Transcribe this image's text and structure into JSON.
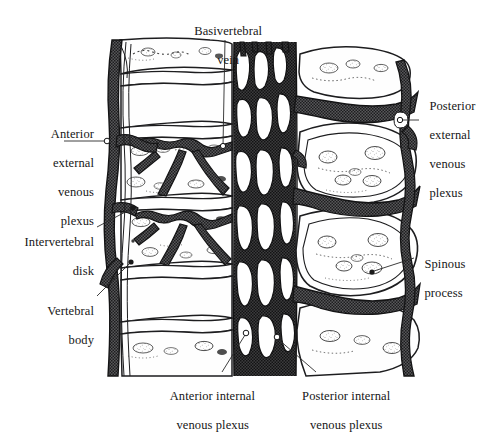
{
  "figure": {
    "kind": "anatomical-illustration",
    "background_color": "#ffffff",
    "ink_color": "#1a1a1a",
    "vein_fill_color": "#4a4a4a",
    "bone_fill_color": "#fdfdfd",
    "drawing_bounds": {
      "x": 100,
      "y": 38,
      "width": 322,
      "height": 340
    }
  },
  "labels": [
    {
      "id": "basivertebral-vein",
      "name": "basivertebral-vein",
      "lines": [
        "Basivertebral",
        "vein"
      ],
      "align": "center",
      "x": 164,
      "y": 10,
      "width": 122,
      "leader": {
        "from": [
          225,
          40
        ],
        "to": [
          223,
          146
        ],
        "marker": "open-dot"
      }
    },
    {
      "id": "anterior-external-venous-plexus",
      "name": "anterior-external-venous-plexus",
      "lines": [
        "Anterior",
        "external",
        "venous",
        "plexus"
      ],
      "align": "right",
      "x": 8,
      "y": 113,
      "width": 86,
      "leader": {
        "from": [
          64,
          141
        ],
        "to": [
          108,
          141
        ],
        "marker": "open-dot"
      }
    },
    {
      "id": "intervertebral-disk",
      "name": "intervertebral-disk",
      "lines": [
        "Intervertebral",
        "disk"
      ],
      "align": "right",
      "x": 4,
      "y": 221,
      "width": 90,
      "leader": {
        "from": [
          97,
          227
        ],
        "to": [
          133,
          208
        ],
        "marker": "filled-dot"
      }
    },
    {
      "id": "vertebral-body",
      "name": "vertebral-body",
      "lines": [
        "Vertebral",
        "body"
      ],
      "align": "right",
      "x": 14,
      "y": 290,
      "width": 80,
      "leader": {
        "from": [
          97,
          296
        ],
        "to": [
          131,
          262
        ],
        "marker": "filled-dot"
      }
    },
    {
      "id": "posterior-external-venous-plexus",
      "name": "posterior-external-venous-plexus",
      "lines": [
        "Posterior",
        "external",
        "venous",
        "plexus"
      ],
      "align": "left",
      "x": 423,
      "y": 85,
      "width": 56,
      "leader": {
        "from": [
          419,
          120
        ],
        "to": [
          399,
          120
        ],
        "marker": "open-dot"
      }
    },
    {
      "id": "spinous-process",
      "name": "spinous-process",
      "lines": [
        "Spinous",
        "process"
      ],
      "align": "left",
      "x": 418,
      "y": 243,
      "width": 58,
      "leader": {
        "from": [
          414,
          258
        ],
        "to": [
          372,
          272
        ],
        "marker": "filled-dot"
      }
    },
    {
      "id": "anterior-internal-venous-plexus",
      "name": "anterior-internal-venous-plexus",
      "lines": [
        "Anterior internal",
        "venous plexus"
      ],
      "align": "center",
      "x": 147,
      "y": 375,
      "width": 125,
      "leader": {
        "from": [
          222,
          372
        ],
        "to": [
          245,
          333
        ],
        "marker": "open-dot"
      }
    },
    {
      "id": "posterior-internal-venous-plexus",
      "name": "posterior-internal-venous-plexus",
      "lines": [
        "Posterior internal",
        "venous plexus"
      ],
      "align": "center",
      "x": 278,
      "y": 375,
      "width": 130,
      "leader": {
        "from": [
          316,
          372
        ],
        "to": [
          277,
          337
        ],
        "marker": "open-dot"
      }
    }
  ]
}
